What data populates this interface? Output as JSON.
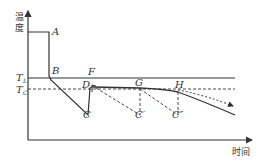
{
  "diagram": {
    "y_axis_label": "温度",
    "y_axis_label_line1": "温",
    "y_axis_label_line2": "度",
    "x_axis_label": "时间",
    "levels": {
      "TL": "T",
      "TL_sub": "L",
      "TC": "T",
      "TC_sub": "C"
    },
    "points": {
      "A": "A",
      "B": "B",
      "C": "C",
      "D": "D",
      "F": "F",
      "G": "G",
      "H": "H",
      "C1": "C′",
      "C2": "C″"
    },
    "colors": {
      "line": "#333333",
      "background": "#ffffff"
    }
  }
}
